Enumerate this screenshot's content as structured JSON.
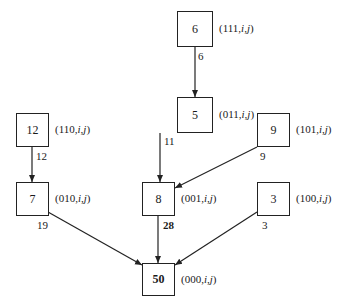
{
  "nodes": [
    {
      "id": "n111",
      "value": "6",
      "label": "(111,i,j)",
      "x": 177,
      "y": 11,
      "w": 36,
      "h": 36,
      "bold": false
    },
    {
      "id": "n110",
      "value": "12",
      "label": "(110,i,j)",
      "x": 16,
      "y": 113,
      "w": 33,
      "h": 34,
      "bold": false
    },
    {
      "id": "n011",
      "value": "5",
      "label": "(011,i,j)",
      "x": 177,
      "y": 97,
      "w": 36,
      "h": 36,
      "bold": false
    },
    {
      "id": "n101",
      "value": "9",
      "label": "(101,i,j)",
      "x": 257,
      "y": 113,
      "w": 33,
      "h": 34,
      "bold": false
    },
    {
      "id": "n010",
      "value": "7",
      "label": "(010,i,j)",
      "x": 16,
      "y": 182,
      "w": 33,
      "h": 34,
      "bold": false
    },
    {
      "id": "n001",
      "value": "8",
      "label": "(001,i,j)",
      "x": 142,
      "y": 182,
      "w": 33,
      "h": 34,
      "bold": false
    },
    {
      "id": "n100",
      "value": "3",
      "label": "(100,i,j)",
      "x": 257,
      "y": 182,
      "w": 33,
      "h": 34,
      "bold": false
    },
    {
      "id": "n000",
      "value": "50",
      "label": "(000,i,j)",
      "x": 142,
      "y": 263,
      "w": 33,
      "h": 33,
      "bold": true
    }
  ],
  "edges": [
    {
      "from": "n111",
      "to": "n011",
      "weight": "6",
      "x1": 195,
      "y1": 47,
      "x2": 195,
      "y2": 97,
      "wx": 198,
      "wy": 50,
      "bold": false
    },
    {
      "from": "n110",
      "to": "n010",
      "weight": "12",
      "x1": 32,
      "y1": 147,
      "x2": 32,
      "y2": 182,
      "wx": 36,
      "wy": 150,
      "bold": false
    },
    {
      "from": "n011",
      "to": "n001",
      "weight": "11",
      "x1": 160,
      "y1": 133,
      "x2": 160,
      "y2": 182,
      "wx": 164,
      "wy": 135,
      "bold": false
    },
    {
      "from": "n101",
      "to": "n001",
      "weight": "9",
      "x1": 257,
      "y1": 147,
      "x2": 175,
      "y2": 188,
      "wx": 260,
      "wy": 150,
      "bold": false
    },
    {
      "from": "n010",
      "to": "n000",
      "weight": "19",
      "x1": 48,
      "y1": 212,
      "x2": 142,
      "y2": 265,
      "wx": 37,
      "wy": 219,
      "bold": false
    },
    {
      "from": "n001",
      "to": "n000",
      "weight": "28",
      "x1": 158,
      "y1": 216,
      "x2": 158,
      "y2": 263,
      "wx": 163,
      "wy": 219,
      "bold": true
    },
    {
      "from": "n100",
      "to": "n000",
      "weight": "3",
      "x1": 257,
      "y1": 212,
      "x2": 175,
      "y2": 265,
      "wx": 262,
      "wy": 219,
      "bold": false
    }
  ],
  "colors": {
    "stroke": "#222222",
    "background": "#ffffff"
  }
}
